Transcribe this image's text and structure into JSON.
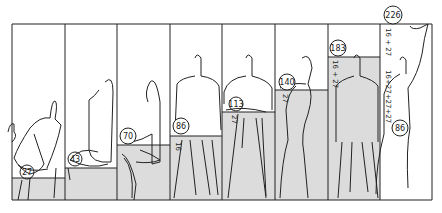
{
  "diagram": {
    "type": "modulor-human-postures",
    "colors": {
      "line": "#222222",
      "shade": "#dcdcdc",
      "background": "#ffffff"
    },
    "panels": [
      {
        "posture": "seated-low",
        "label": "27"
      },
      {
        "posture": "reclining",
        "label": "43"
      },
      {
        "posture": "seated-leaning",
        "label": "70"
      },
      {
        "posture": "standing-hand-on-table",
        "label": "86",
        "side_label": "16"
      },
      {
        "posture": "standing-arms-folded",
        "label": "113",
        "side_label": "27"
      },
      {
        "posture": "standing-arm-on-shelf",
        "label": "140",
        "side_label": "27"
      },
      {
        "posture": "standing-upright",
        "label": "183",
        "side_label": "16 + 27"
      },
      {
        "posture": "standing-arm-raised",
        "label": "226",
        "side_label_top": "16 + 27",
        "side_label_bottom": "16+27+27+27",
        "hand_label": "86"
      }
    ]
  }
}
